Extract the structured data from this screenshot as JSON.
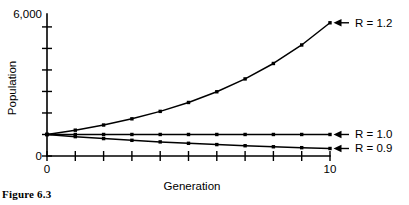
{
  "figure": {
    "caption": "Figure 6.3"
  },
  "chart_data": {
    "type": "line",
    "title": "",
    "xlabel": "Generation",
    "ylabel": "Population",
    "xlim": [
      0,
      10
    ],
    "ylim": [
      0,
      6600
    ],
    "grid": false,
    "legend_position": "right-annotations",
    "x": [
      0,
      1,
      2,
      3,
      4,
      5,
      6,
      7,
      8,
      9,
      10
    ],
    "x_tick_labels": [
      "0",
      "10"
    ],
    "x_tick_values": [
      0,
      10
    ],
    "x_tick_count": 11,
    "y_tick_labels": [
      "0",
      "6,000"
    ],
    "y_tick_values": [
      0,
      6000
    ],
    "y_tick_count": 7,
    "y_tick_step": 1000,
    "marker": "square",
    "series": [
      {
        "name": "R = 1.2",
        "label": "R = 1.2",
        "rate": 1.2,
        "values": [
          1000,
          1200,
          1440,
          1728,
          2074,
          2488,
          2986,
          3583,
          4300,
          5160,
          6192
        ]
      },
      {
        "name": "R = 1.0",
        "label": "R = 1.0",
        "rate": 1.0,
        "values": [
          1000,
          1000,
          1000,
          1000,
          1000,
          1000,
          1000,
          1000,
          1000,
          1000,
          1000
        ]
      },
      {
        "name": "R = 0.9",
        "label": "R = 0.9",
        "rate": 0.9,
        "values": [
          1000,
          900,
          810,
          729,
          656,
          590,
          531,
          478,
          430,
          387,
          349
        ]
      }
    ],
    "annotations": [
      {
        "text": "R = 1.2",
        "points_to_series": "R = 1.2",
        "arrow": "left"
      },
      {
        "text": "R = 1.0",
        "points_to_series": "R = 1.0",
        "arrow": "left"
      },
      {
        "text": "R = 0.9",
        "points_to_series": "R = 0.9",
        "arrow": "left"
      }
    ]
  }
}
